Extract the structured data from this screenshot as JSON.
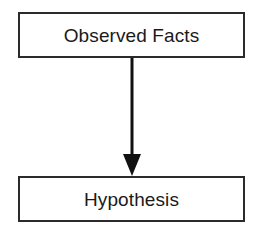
{
  "diagram": {
    "background_color": "#ffffff",
    "border_color": "#2b2b2b",
    "text_color": "#1a1a1a",
    "arrow_color": "#111111",
    "nodes": [
      {
        "id": "observed-facts",
        "label": "Observed Facts"
      },
      {
        "id": "hypothesis",
        "label": "Hypothesis"
      }
    ],
    "connector": {
      "from": "observed-facts",
      "to": "hypothesis",
      "style": "solid-line-with-filled-arrowhead",
      "direction": "down"
    }
  }
}
